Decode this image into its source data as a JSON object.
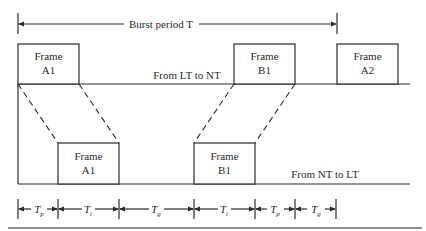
{
  "burst": {
    "label": "Burst period T"
  },
  "top_line": {
    "label": "From LT to NT"
  },
  "bottom_line": {
    "label": "From NT to LT"
  },
  "frames_top": [
    {
      "line1": "Frame",
      "line2": "A1"
    },
    {
      "line1": "Frame",
      "line2": "B1"
    },
    {
      "line1": "Frame",
      "line2": "A2"
    }
  ],
  "frames_bottom": [
    {
      "line1": "Frame",
      "line2": "A1"
    },
    {
      "line1": "Frame",
      "line2": "B1"
    }
  ],
  "intervals": [
    {
      "base": "T",
      "sub": "p"
    },
    {
      "base": "T",
      "sub": "t"
    },
    {
      "base": "T",
      "sub": "g"
    },
    {
      "base": "T",
      "sub": "t"
    },
    {
      "base": "T",
      "sub": "p"
    },
    {
      "base": "T",
      "sub": "g"
    }
  ]
}
